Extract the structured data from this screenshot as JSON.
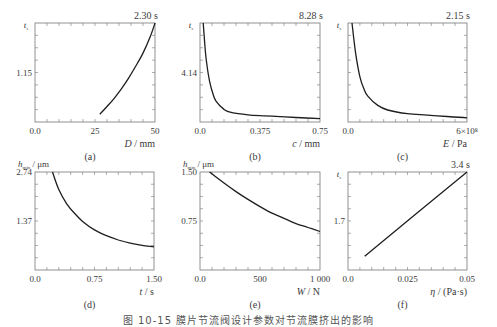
{
  "figure": {
    "caption": "图 10-15  膜片节流阀设计参数对节流膜挤出的影响"
  },
  "chart_data": [
    {
      "id": "a",
      "panel_label": "(a)",
      "type": "line",
      "title": "",
      "ylabel": "t_s",
      "xlabel": "D / mm",
      "xlabel_var": "D",
      "xlabel_unit": "/ mm",
      "corner_annotation": "2.30 s",
      "xlim": [
        0,
        50
      ],
      "ylim": [
        0,
        2.3
      ],
      "x_ticks": [
        "0.0",
        "25",
        "50"
      ],
      "y_ticks": [
        "1.15"
      ],
      "grid": false,
      "x": [
        27,
        30,
        33,
        36,
        39,
        42,
        45,
        48,
        50
      ],
      "y": [
        0.18,
        0.36,
        0.55,
        0.77,
        1.02,
        1.3,
        1.6,
        1.98,
        2.3
      ]
    },
    {
      "id": "b",
      "panel_label": "(b)",
      "type": "line",
      "ylabel": "t_s",
      "xlabel": "c / mm",
      "xlabel_var": "c",
      "xlabel_unit": "/ mm",
      "corner_annotation": "8.28 s",
      "xlim": [
        0,
        0.75
      ],
      "ylim": [
        0,
        8.28
      ],
      "x_ticks": [
        "0.0",
        "0.375",
        "0.75"
      ],
      "y_ticks": [
        "4.14"
      ],
      "grid": false,
      "x": [
        0.02,
        0.03,
        0.04,
        0.06,
        0.08,
        0.1,
        0.15,
        0.2,
        0.3,
        0.4,
        0.5,
        0.6,
        0.75
      ],
      "y": [
        8.28,
        6.5,
        5.1,
        3.4,
        2.4,
        1.75,
        1.05,
        0.78,
        0.6,
        0.52,
        0.45,
        0.38,
        0.28
      ]
    },
    {
      "id": "c",
      "panel_label": "(c)",
      "type": "line",
      "ylabel": "t_s",
      "xlabel": "E / Pa",
      "xlabel_var": "E",
      "xlabel_unit": "/ Pa",
      "corner_annotation": "2.15 s",
      "xlim": [
        0,
        600000000.0
      ],
      "ylim": [
        0,
        2.15
      ],
      "x_ticks": [
        "0.0",
        "6×10⁸"
      ],
      "y_ticks": [],
      "grid": false,
      "x": [
        20000000.0,
        40000000.0,
        60000000.0,
        80000000.0,
        100000000.0,
        150000000.0,
        200000000.0,
        300000000.0,
        400000000.0,
        500000000.0,
        600000000.0
      ],
      "y": [
        2.15,
        1.45,
        0.98,
        0.72,
        0.56,
        0.36,
        0.26,
        0.18,
        0.15,
        0.12,
        0.09
      ]
    },
    {
      "id": "d",
      "panel_label": "(d)",
      "type": "line",
      "ylabel": "h_min / μm",
      "xlabel": "t / s",
      "xlabel_var": "t",
      "xlabel_unit": "/ s",
      "xlim": [
        0,
        1.5
      ],
      "ylim": [
        0,
        2.74
      ],
      "x_ticks": [
        "0.0",
        "0.75",
        "1.50"
      ],
      "y_ticks": [
        "2.74",
        "1.37"
      ],
      "grid": false,
      "x": [
        0.22,
        0.3,
        0.4,
        0.5,
        0.6,
        0.75,
        0.9,
        1.05,
        1.2,
        1.35,
        1.5
      ],
      "y": [
        2.74,
        2.25,
        1.85,
        1.58,
        1.36,
        1.12,
        0.96,
        0.84,
        0.75,
        0.69,
        0.65
      ]
    },
    {
      "id": "e",
      "panel_label": "(e)",
      "type": "line",
      "ylabel": "h_min / μm",
      "xlabel": "W / N",
      "xlabel_var": "W",
      "xlabel_unit": "/ N",
      "xlim": [
        0,
        1000
      ],
      "ylim": [
        0,
        1.5
      ],
      "x_ticks": [
        "0.0",
        "500",
        "1 000"
      ],
      "y_ticks": [
        "1.50",
        "0.75"
      ],
      "grid": false,
      "x": [
        80,
        200,
        300,
        400,
        500,
        600,
        700,
        800,
        900,
        1000
      ],
      "y": [
        1.5,
        1.33,
        1.2,
        1.08,
        0.97,
        0.87,
        0.79,
        0.71,
        0.65,
        0.59
      ]
    },
    {
      "id": "f",
      "panel_label": "(f)",
      "type": "line",
      "ylabel": "t_s",
      "xlabel": "η / (Pa·s)",
      "xlabel_var": "η",
      "xlabel_unit": "/ (Pa·s)",
      "corner_annotation": "3.4 s",
      "xlim": [
        0,
        0.05
      ],
      "ylim": [
        0,
        3.4
      ],
      "x_ticks": [
        "0.0",
        "0.025",
        "0.05"
      ],
      "y_ticks": [
        "1.7"
      ],
      "grid": false,
      "x": [
        0.007,
        0.05
      ],
      "y": [
        0.48,
        3.4
      ]
    }
  ]
}
